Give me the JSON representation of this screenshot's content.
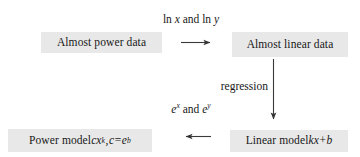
{
  "figure": {
    "type": "commutative-diagram",
    "background_color": "#ffffff",
    "node_fill_color": "#e8e8e8",
    "text_color": "#181818",
    "arrow_color": "#404040"
  },
  "nodes": {
    "power_data": {
      "id": "almost-power-data",
      "label": "Almost power data",
      "position": "top-left"
    },
    "linear_data": {
      "id": "almost-linear-data",
      "label": "Almost linear data",
      "position": "top-right"
    },
    "power_model": {
      "id": "power-model",
      "label_prefix": "Power model ",
      "expr_c": "c",
      "expr_x": "x",
      "expr_k": "k",
      "expr_comma": ", ",
      "expr_c2": "c",
      "expr_equals": " = ",
      "expr_e": "e",
      "expr_b": "b",
      "label_plain": "Power model cx^k, c = e^b",
      "position": "bottom-left"
    },
    "linear_model": {
      "id": "linear-model",
      "label_prefix": "Linear model ",
      "expr_k": "k",
      "expr_x": "x",
      "expr_plus": " + ",
      "expr_b": "b",
      "label_plain": "Linear model kx + b",
      "position": "bottom-right"
    }
  },
  "edges": {
    "top": {
      "id": "transform-forward",
      "direction": "right",
      "from": "power_data",
      "to": "linear_data",
      "label_ln1": "ln ",
      "label_x": "x",
      "label_and": " and ",
      "label_ln2": "ln ",
      "label_y": "y",
      "label_plain": "ln x and ln y"
    },
    "right": {
      "id": "regression",
      "direction": "down",
      "from": "linear_data",
      "to": "linear_model",
      "label": "regression"
    },
    "bottom": {
      "id": "transform-back",
      "direction": "left",
      "from": "linear_model",
      "to": "power_model",
      "label_e1": "e",
      "label_x": "x",
      "label_and": " and ",
      "label_e2": "e",
      "label_y": "y",
      "label_plain": "e^x and e^y"
    }
  }
}
